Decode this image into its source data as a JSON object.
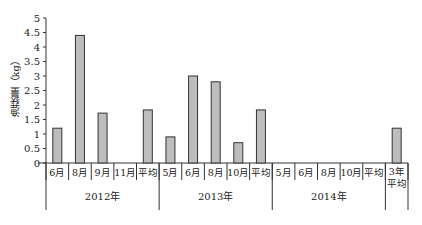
{
  "chart_data": {
    "type": "bar",
    "title": "",
    "xlabel": "",
    "ylabel": "渔获量（kg）",
    "ylim": [
      0,
      5
    ],
    "yticks": [
      0,
      0.5,
      1,
      1.5,
      2,
      2.5,
      3,
      3.5,
      4,
      4.5,
      5
    ],
    "ytick_labels": [
      "0",
      "0.5",
      "1",
      "1.5",
      "2",
      "2.5",
      "3",
      "3.5",
      "4",
      "4.5",
      "5"
    ],
    "grid": false,
    "legend": null,
    "categories": [
      "6月",
      "8月",
      "9月",
      "11月",
      "平均",
      "5月",
      "6月",
      "8月",
      "10月",
      "平均",
      "5月",
      "6月",
      "8月",
      "10月",
      "平均",
      "3年平均"
    ],
    "groups": [
      {
        "label": "2012年",
        "span": [
          0,
          4
        ]
      },
      {
        "label": "2013年",
        "span": [
          5,
          9
        ]
      },
      {
        "label": "2014年",
        "span": [
          10,
          14
        ]
      },
      {
        "label": "",
        "span": [
          15,
          15
        ]
      }
    ],
    "values": [
      1.2,
      4.4,
      1.72,
      0,
      1.83,
      0.9,
      3.0,
      2.8,
      0.7,
      1.83,
      0,
      0,
      0,
      0,
      0,
      1.2
    ],
    "bar_color": "#bdbdbd",
    "bar_edge_color": "#333333"
  }
}
